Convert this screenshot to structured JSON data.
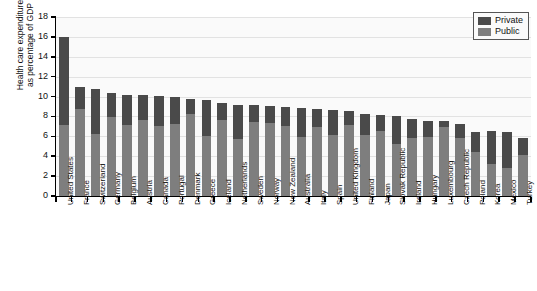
{
  "chart_data": {
    "type": "bar",
    "subtype": "stacked-vertical",
    "title": "",
    "xlabel": "",
    "ylabel": "Health care expenditure\nas percentage of GDP",
    "ylim": [
      0,
      18
    ],
    "ytick_values": [
      0,
      2,
      4,
      6,
      8,
      10,
      12,
      14,
      16,
      18
    ],
    "ytick_labels": [
      "0",
      "2",
      "4",
      "6",
      "8",
      "10",
      "12",
      "14",
      "16",
      "18"
    ],
    "grid": true,
    "grid_axis": "y",
    "legend_position": "top-right",
    "categories": [
      "United States",
      "France",
      "Switzerland",
      "Germany",
      "Belgium",
      "Austria",
      "Canada",
      "Portugal",
      "Denmark",
      "Greece",
      "Iceland",
      "Netherlands",
      "Sweden",
      "Norway",
      "New Zealand",
      "Australia",
      "Italy",
      "Spain",
      "United Kingdom",
      "Finland",
      "Japan",
      "Slovak Republic",
      "Ireland",
      "Hungary",
      "Luxembourg",
      "Czech Republic",
      "Poland",
      "Korea",
      "Mexico",
      "Turkey"
    ],
    "series": [
      {
        "name": "Public",
        "color": "#7e7e7e",
        "values": [
          7.1,
          8.7,
          6.2,
          7.9,
          7.1,
          7.6,
          7.0,
          7.2,
          8.2,
          6.0,
          7.6,
          5.7,
          7.4,
          7.3,
          7.0,
          5.9,
          6.9,
          6.1,
          7.1,
          6.1,
          6.5,
          5.2,
          5.8,
          5.9,
          6.9,
          5.8,
          4.4,
          3.2,
          2.8,
          4.1
        ]
      },
      {
        "name": "Private",
        "color": "#4a4a4a",
        "values": [
          8.9,
          2.3,
          4.6,
          2.5,
          3.1,
          2.6,
          3.1,
          2.8,
          1.6,
          3.7,
          1.8,
          3.5,
          1.8,
          1.8,
          2.0,
          3.0,
          1.9,
          2.5,
          1.4,
          2.1,
          1.6,
          2.8,
          1.9,
          1.6,
          0.6,
          1.4,
          2.0,
          3.3,
          3.6,
          1.7
        ]
      }
    ],
    "totals": [
      16.0,
      11.0,
      10.8,
      10.4,
      10.2,
      10.2,
      10.1,
      10.0,
      9.8,
      9.7,
      9.4,
      9.2,
      9.2,
      9.1,
      9.0,
      8.9,
      8.8,
      8.6,
      8.5,
      8.2,
      8.1,
      8.0,
      7.7,
      7.5,
      7.5,
      7.2,
      6.4,
      6.5,
      6.4,
      5.8
    ]
  },
  "legend": {
    "items": [
      {
        "label": "Private",
        "color": "#4a4a4a"
      },
      {
        "label": "Public",
        "color": "#7e7e7e"
      }
    ]
  }
}
